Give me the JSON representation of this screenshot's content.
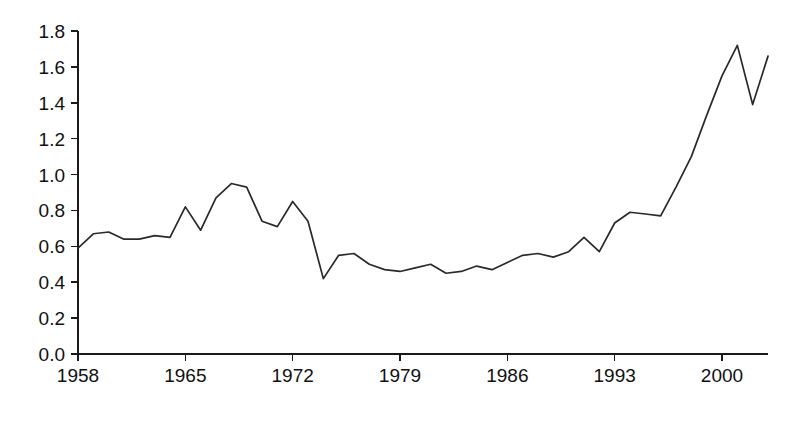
{
  "chart_data": {
    "type": "line",
    "title": "",
    "subtitle": "",
    "xlabel": "",
    "ylabel": "",
    "xlim": [
      1958,
      2003
    ],
    "ylim": [
      0.0,
      1.8
    ],
    "grid": false,
    "legend": false,
    "legend_position": "none",
    "line_color": "#2a2a2a",
    "background_color": "#ffffff",
    "axis_color": "#1a1a1a",
    "y_ticks": [
      "0.0",
      "0.2",
      "0.4",
      "0.6",
      "0.8",
      "1.0",
      "1.2",
      "1.4",
      "1.6",
      "1.8"
    ],
    "y_tick_values": [
      0.0,
      0.2,
      0.4,
      0.6,
      0.8,
      1.0,
      1.2,
      1.4,
      1.6,
      1.8
    ],
    "x_ticks": [
      "1958",
      "1965",
      "1972",
      "1979",
      "1986",
      "1993",
      "2000"
    ],
    "x_tick_values": [
      1958,
      1965,
      1972,
      1979,
      1986,
      1993,
      2000
    ],
    "x": [
      1958,
      1959,
      1960,
      1961,
      1962,
      1963,
      1964,
      1965,
      1966,
      1967,
      1968,
      1969,
      1970,
      1971,
      1972,
      1973,
      1974,
      1975,
      1976,
      1977,
      1978,
      1979,
      1980,
      1981,
      1982,
      1983,
      1984,
      1985,
      1986,
      1987,
      1988,
      1989,
      1990,
      1991,
      1992,
      1993,
      1994,
      1995,
      1996,
      1997,
      1998,
      1999,
      2000,
      2001,
      2002,
      2003
    ],
    "series": [
      {
        "name": "series-1",
        "values": [
          0.59,
          0.67,
          0.68,
          0.64,
          0.64,
          0.66,
          0.65,
          0.82,
          0.69,
          0.87,
          0.95,
          0.93,
          0.74,
          0.71,
          0.85,
          0.74,
          0.42,
          0.55,
          0.56,
          0.5,
          0.47,
          0.46,
          0.48,
          0.5,
          0.45,
          0.46,
          0.49,
          0.47,
          0.51,
          0.55,
          0.56,
          0.54,
          0.57,
          0.65,
          0.57,
          0.73,
          0.79,
          0.78,
          0.77,
          0.93,
          1.1,
          1.33,
          1.55,
          1.72,
          1.39,
          1.66
        ]
      }
    ]
  },
  "axes": {
    "x_axis_name": "year-axis",
    "y_axis_name": "value-axis"
  }
}
